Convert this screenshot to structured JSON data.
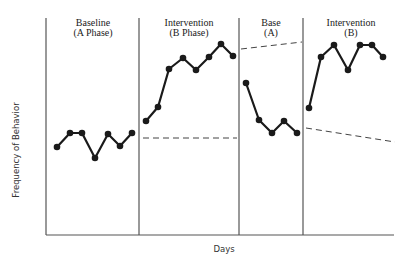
{
  "chart_data": {
    "type": "line",
    "title": "",
    "xlabel": "Days",
    "ylabel": "Frequency of Behavior",
    "grid": false,
    "legend": null,
    "phases": [
      {
        "name": "Baseline (A Phase)",
        "line1": "Baseline",
        "line2": "(A Phase)"
      },
      {
        "name": "Intervention (B Phase)",
        "line1": "Intervention",
        "line2": "(B Phase)"
      },
      {
        "name": "Base (A)",
        "line1": "Base",
        "line2": "(A)"
      },
      {
        "name": "Intervention (B)",
        "line1": "Intervention",
        "line2": "(B)"
      }
    ],
    "series": [
      {
        "name": "Baseline (A Phase)",
        "values": [
          147,
          133,
          133,
          158,
          134,
          146,
          133
        ]
      },
      {
        "name": "Intervention (B Phase)",
        "values": [
          121,
          107,
          69,
          58,
          70,
          57,
          44,
          56
        ]
      },
      {
        "name": "Base (A)",
        "values": [
          83,
          120,
          133,
          121,
          133
        ]
      },
      {
        "name": "Intervention (B)",
        "values": [
          108,
          57,
          45,
          70,
          45,
          45,
          57
        ]
      }
    ],
    "value_note": "Values are pixel y-positions (lower number = higher frequency); y-axis has no numeric ticks.",
    "trend_lines": [
      {
        "phase": "Intervention (B Phase)",
        "style": "dashed",
        "description": "flat, level with baseline mean"
      },
      {
        "phase": "Base (A)",
        "style": "dashed",
        "description": "slightly rising, near top"
      },
      {
        "phase": "Intervention (B)",
        "style": "dashed",
        "description": "slightly declining, level with prior baseline"
      }
    ]
  },
  "labels": {
    "x_axis": "Days",
    "y_axis": "Frequency of Behavior",
    "phase1_l1": "Baseline",
    "phase1_l2": "(A Phase)",
    "phase2_l1": "Intervention",
    "phase2_l2": "(B Phase)",
    "phase3_l1": "Base",
    "phase3_l2": "(A)",
    "phase4_l1": "Intervention",
    "phase4_l2": "(B)"
  }
}
